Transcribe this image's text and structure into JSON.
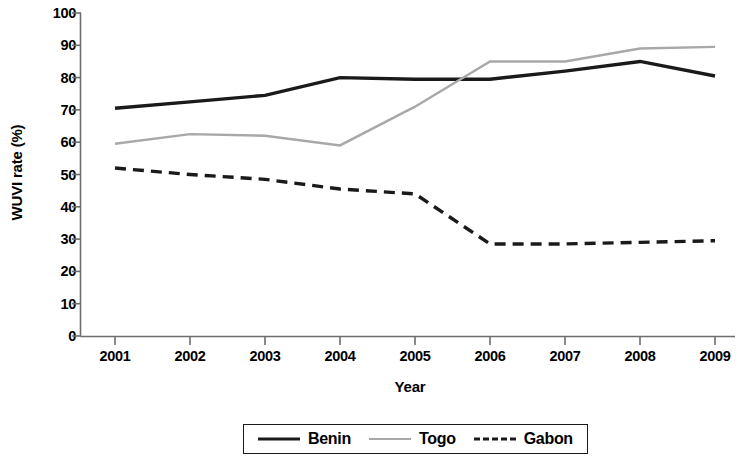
{
  "chart_data": {
    "type": "line",
    "title": "",
    "xlabel": "Year",
    "ylabel": "WUVI rate (%)",
    "categories": [
      "2001",
      "2002",
      "2003",
      "2004",
      "2005",
      "2006",
      "2007",
      "2008",
      "2009"
    ],
    "x": [
      2001,
      2002,
      2003,
      2004,
      2005,
      2006,
      2007,
      2008,
      2009
    ],
    "xlim": [
      2001,
      2009
    ],
    "ylim": [
      0,
      100
    ],
    "yticks": [
      0,
      10,
      20,
      30,
      40,
      50,
      60,
      70,
      80,
      90,
      100
    ],
    "ytick_labels": [
      "0",
      "10",
      "20",
      "30",
      "40",
      "50",
      "60",
      "70",
      "80",
      "90",
      "100"
    ],
    "grid": false,
    "legend_position": "bottom",
    "series": [
      {
        "name": "Benin",
        "color": "#1a1a1a",
        "style": "solid",
        "width": 3.4,
        "values": [
          70.5,
          72.5,
          74.5,
          80.0,
          79.5,
          79.5,
          82.0,
          85.0,
          80.5
        ]
      },
      {
        "name": "Togo",
        "color": "#a8a8a8",
        "style": "solid",
        "width": 2.4,
        "values": [
          59.5,
          62.5,
          62.0,
          59.0,
          71.0,
          85.0,
          85.0,
          89.0,
          89.5
        ]
      },
      {
        "name": "Gabon",
        "color": "#1a1a1a",
        "style": "dashed",
        "width": 3.4,
        "values": [
          52.0,
          50.0,
          48.5,
          45.5,
          44.0,
          28.5,
          28.5,
          29.0,
          29.5
        ]
      }
    ]
  },
  "axes": {
    "y_title": "WUVI rate (%)",
    "x_title": "Year",
    "y_ticks": [
      "100",
      "90",
      "80",
      "70",
      "60",
      "50",
      "40",
      "30",
      "20",
      "10",
      "0"
    ],
    "x_ticks": [
      "2001",
      "2002",
      "2003",
      "2004",
      "2005",
      "2006",
      "2007",
      "2008",
      "2009"
    ]
  },
  "legend": {
    "items": [
      {
        "label": "Benin",
        "swatch": "solid-dark-line-icon"
      },
      {
        "label": "Togo",
        "swatch": "solid-gray-line-icon"
      },
      {
        "label": "Gabon",
        "swatch": "dashed-dark-line-icon"
      }
    ]
  }
}
